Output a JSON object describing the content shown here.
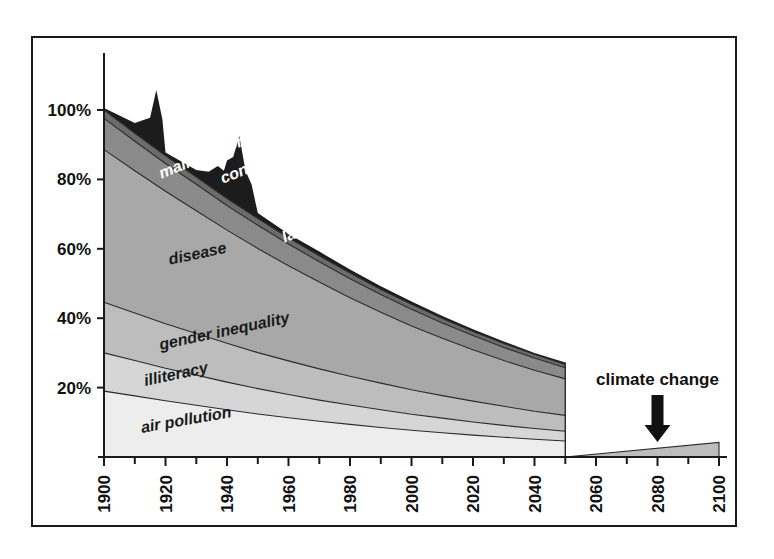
{
  "chart_data": {
    "type": "area",
    "title": "",
    "subtitle": "",
    "xlabel": "",
    "ylabel": "",
    "stacked": true,
    "grid": false,
    "legend_position": "inline-labels",
    "xlim": [
      1900,
      2100
    ],
    "ylim": [
      0,
      115
    ],
    "x_tick_labels": [
      "1900",
      "1920",
      "1940",
      "1960",
      "1980",
      "2000",
      "2020",
      "2040",
      "2060",
      "2080",
      "2100"
    ],
    "x_tick_values": [
      1900,
      1920,
      1940,
      1960,
      1980,
      2000,
      2020,
      2040,
      2060,
      2080,
      2100
    ],
    "x_minor_tick_values": [
      1910,
      1930,
      1950,
      1970,
      1990,
      2010,
      2030,
      2050,
      2070,
      2090
    ],
    "y_tick_labels": [
      "20%",
      "40%",
      "60%",
      "80%",
      "100%"
    ],
    "y_tick_values": [
      20,
      40,
      60,
      80,
      100
    ],
    "x": [
      1900,
      1910,
      1920,
      1930,
      1940,
      1950,
      1960,
      1970,
      1980,
      1990,
      2000,
      2010,
      2020,
      2030,
      2040,
      2050
    ],
    "series": [
      {
        "name": "air pollution",
        "label": "air pollution",
        "color": "#ededed",
        "label_color": "#1a1a1a",
        "values": [
          19.0,
          17.6,
          16.2,
          14.9,
          13.6,
          12.4,
          11.3,
          10.3,
          9.4,
          8.5,
          7.7,
          7.0,
          6.3,
          5.7,
          5.1,
          4.6
        ]
      },
      {
        "name": "illiteracy",
        "label": "illiteracy",
        "color": "#d6d6d6",
        "label_color": "#1a1a1a",
        "values": [
          11.0,
          10.2,
          9.4,
          8.7,
          8.0,
          7.3,
          6.7,
          6.1,
          5.6,
          5.1,
          4.6,
          4.2,
          3.8,
          3.4,
          3.1,
          2.8
        ]
      },
      {
        "name": "gender inequality",
        "label": "gender inequality",
        "color": "#bdbdbd",
        "label_color": "#1a1a1a",
        "values": [
          14.6,
          13.7,
          12.8,
          12.0,
          11.2,
          10.4,
          9.7,
          9.0,
          8.3,
          7.7,
          7.1,
          6.5,
          6.0,
          5.5,
          5.0,
          4.6
        ]
      },
      {
        "name": "disease",
        "label": "disease",
        "color": "#a8a8a8",
        "label_color": "#1a1a1a",
        "values": [
          44.0,
          41.0,
          38.2,
          35.4,
          32.6,
          30.0,
          27.4,
          25.0,
          22.6,
          20.4,
          18.4,
          16.5,
          14.8,
          13.2,
          11.8,
          10.5
        ]
      },
      {
        "name": "malnutrition",
        "label": "malnutrition",
        "color": "#8a8a8a",
        "label_color": "#ffffff",
        "values": [
          9.0,
          8.5,
          8.0,
          7.6,
          7.1,
          6.7,
          6.3,
          5.9,
          5.5,
          5.1,
          4.8,
          4.4,
          4.1,
          3.8,
          3.5,
          3.2
        ]
      },
      {
        "name": "lack of free trade",
        "label": "lack of free trade",
        "color": "#6b6b6b",
        "label_color": "#ffffff",
        "values": [
          2.4,
          2.3,
          2.2,
          2.1,
          2.0,
          1.9,
          1.8,
          1.7,
          1.6,
          1.5,
          1.4,
          1.3,
          1.2,
          1.1,
          1.0,
          1.0
        ]
      },
      {
        "name": "conflicts",
        "label": "conflicts",
        "color": "#1c1c1c",
        "label_color": "#ffffff",
        "values": [
          0.6,
          3.0,
          1.0,
          2.0,
          11.0,
          1.6,
          1.1,
          1.2,
          1.0,
          0.9,
          0.8,
          0.7,
          0.6,
          0.6,
          0.5,
          0.5
        ],
        "note": "two sharp spikes: ~1917 (WWI) peaking above 108%, ~1944 (WWII) peaking above 113%"
      }
    ],
    "annotations": [
      {
        "name": "climate-change",
        "label": "climate change",
        "arrow": "down",
        "x": 2080,
        "series_name": "climate change",
        "color": "#bdbdbd",
        "x_range": [
          2050,
          2100
        ],
        "values": [
          0.0,
          4.2
        ]
      }
    ]
  },
  "band_labels": [
    {
      "text": "conflicts",
      "x": 1938,
      "y_frac": 0.5,
      "rotate": -22,
      "style": "light"
    },
    {
      "text": "malnutrition",
      "x": 1918,
      "y_frac": 0.5,
      "rotate": -22,
      "style": "light"
    },
    {
      "text": "lack of free trade",
      "x": 1958,
      "y_frac": 0.5,
      "rotate": -22,
      "style": "light"
    },
    {
      "text": "disease",
      "x": 1921,
      "y_frac": 0.5,
      "rotate": -12,
      "style": "dark"
    },
    {
      "text": "gender inequality",
      "x": 1918,
      "y_frac": 0.5,
      "rotate": -12,
      "style": "dark"
    },
    {
      "text": "illiteracy",
      "x": 1913,
      "y_frac": 0.5,
      "rotate": -12,
      "style": "dark"
    },
    {
      "text": "air pollution",
      "x": 1912,
      "y_frac": 0.5,
      "rotate": -10,
      "style": "dark"
    }
  ]
}
